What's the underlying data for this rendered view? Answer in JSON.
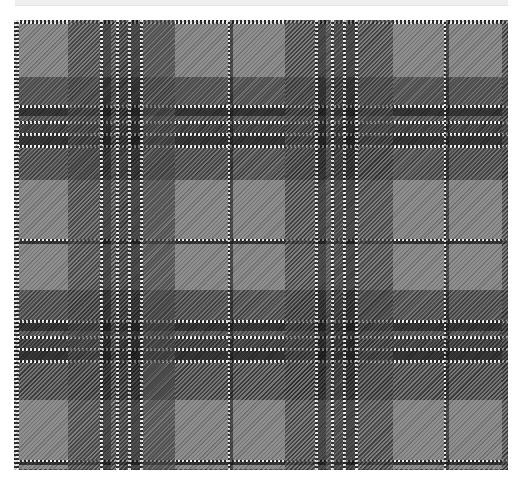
{
  "image": {
    "subject": "grey tartan plaid fabric swatch",
    "colors": {
      "ground": "#8a8a8a",
      "mid": "#5e5e5e",
      "dark": "#3a3a3a",
      "black": "#111111",
      "white": "#f2f2f2",
      "top_strip": "#efefef"
    }
  },
  "warp": [
    {
      "x": 0,
      "w": 5,
      "color": "#a0a0a0",
      "kind": "line"
    },
    {
      "x": 54,
      "w": 32,
      "color": "#5e5e5e",
      "kind": "hatch"
    },
    {
      "x": 86,
      "w": 3,
      "color": "#f2f2f2",
      "kind": "line"
    },
    {
      "x": 89,
      "w": 8,
      "color": "#111111",
      "kind": "solid"
    },
    {
      "x": 97,
      "w": 5,
      "color": "#5e5e5e",
      "kind": "hatch"
    },
    {
      "x": 102,
      "w": 3,
      "color": "#f2f2f2",
      "kind": "line"
    },
    {
      "x": 105,
      "w": 9,
      "color": "#3a3a3a",
      "kind": "hatch"
    },
    {
      "x": 114,
      "w": 3,
      "color": "#f2f2f2",
      "kind": "line"
    },
    {
      "x": 117,
      "w": 9,
      "color": "#111111",
      "kind": "solid"
    },
    {
      "x": 126,
      "w": 3,
      "color": "#f2f2f2",
      "kind": "line"
    },
    {
      "x": 129,
      "w": 32,
      "color": "#5e5e5e",
      "kind": "hatch"
    },
    {
      "x": 214,
      "w": 2,
      "color": "#f2f2f2",
      "kind": "line"
    },
    {
      "x": 216,
      "w": 3,
      "color": "#111111",
      "kind": "solid"
    },
    {
      "x": 271,
      "w": 30,
      "color": "#5e5e5e",
      "kind": "hatch"
    },
    {
      "x": 301,
      "w": 3,
      "color": "#f2f2f2",
      "kind": "line"
    },
    {
      "x": 304,
      "w": 8,
      "color": "#111111",
      "kind": "solid"
    },
    {
      "x": 312,
      "w": 5,
      "color": "#5e5e5e",
      "kind": "hatch"
    },
    {
      "x": 317,
      "w": 3,
      "color": "#f2f2f2",
      "kind": "line"
    },
    {
      "x": 320,
      "w": 9,
      "color": "#3a3a3a",
      "kind": "hatch"
    },
    {
      "x": 329,
      "w": 3,
      "color": "#f2f2f2",
      "kind": "line"
    },
    {
      "x": 332,
      "w": 9,
      "color": "#111111",
      "kind": "solid"
    },
    {
      "x": 341,
      "w": 3,
      "color": "#f2f2f2",
      "kind": "line"
    },
    {
      "x": 344,
      "w": 35,
      "color": "#5e5e5e",
      "kind": "hatch"
    },
    {
      "x": 430,
      "w": 2,
      "color": "#f2f2f2",
      "kind": "line"
    },
    {
      "x": 432,
      "w": 3,
      "color": "#111111",
      "kind": "solid"
    },
    {
      "x": 488,
      "w": 6,
      "color": "#5e5e5e",
      "kind": "hatch"
    }
  ],
  "weft": [
    {
      "y": 0,
      "h": 4,
      "color": "#a0a0a0",
      "kind": "line"
    },
    {
      "y": 57,
      "h": 28,
      "color": "#5e5e5e",
      "kind": "hatch"
    },
    {
      "y": 85,
      "h": 3,
      "color": "#f2f2f2",
      "kind": "line"
    },
    {
      "y": 88,
      "h": 8,
      "color": "#111111",
      "kind": "solid"
    },
    {
      "y": 96,
      "h": 5,
      "color": "#5e5e5e",
      "kind": "hatch"
    },
    {
      "y": 101,
      "h": 3,
      "color": "#f2f2f2",
      "kind": "line"
    },
    {
      "y": 104,
      "h": 9,
      "color": "#3a3a3a",
      "kind": "hatch"
    },
    {
      "y": 113,
      "h": 3,
      "color": "#f2f2f2",
      "kind": "line"
    },
    {
      "y": 116,
      "h": 9,
      "color": "#111111",
      "kind": "solid"
    },
    {
      "y": 125,
      "h": 3,
      "color": "#f2f2f2",
      "kind": "line"
    },
    {
      "y": 128,
      "h": 32,
      "color": "#5e5e5e",
      "kind": "hatch"
    },
    {
      "y": 219,
      "h": 2,
      "color": "#f2f2f2",
      "kind": "line"
    },
    {
      "y": 221,
      "h": 3,
      "color": "#111111",
      "kind": "solid"
    },
    {
      "y": 270,
      "h": 30,
      "color": "#5e5e5e",
      "kind": "hatch"
    },
    {
      "y": 300,
      "h": 3,
      "color": "#f2f2f2",
      "kind": "line"
    },
    {
      "y": 303,
      "h": 8,
      "color": "#111111",
      "kind": "solid"
    },
    {
      "y": 311,
      "h": 5,
      "color": "#5e5e5e",
      "kind": "hatch"
    },
    {
      "y": 316,
      "h": 3,
      "color": "#f2f2f2",
      "kind": "line"
    },
    {
      "y": 319,
      "h": 9,
      "color": "#3a3a3a",
      "kind": "hatch"
    },
    {
      "y": 328,
      "h": 3,
      "color": "#f2f2f2",
      "kind": "line"
    },
    {
      "y": 331,
      "h": 9,
      "color": "#111111",
      "kind": "solid"
    },
    {
      "y": 340,
      "h": 3,
      "color": "#f2f2f2",
      "kind": "line"
    },
    {
      "y": 343,
      "h": 37,
      "color": "#5e5e5e",
      "kind": "hatch"
    },
    {
      "y": 440,
      "h": 2,
      "color": "#f2f2f2",
      "kind": "line"
    },
    {
      "y": 442,
      "h": 3,
      "color": "#111111",
      "kind": "solid"
    }
  ]
}
